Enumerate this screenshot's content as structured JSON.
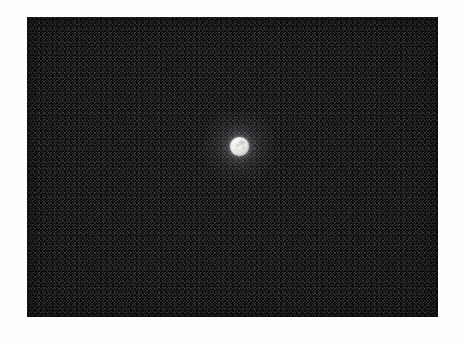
{
  "image": {
    "subject": "full-moon",
    "description": "Photograph of the full Moon as a small bright disc centred in a large expanse of grainy black night sky",
    "medium": "grainy photographic print on white paper",
    "caption": ""
  },
  "canvas": {
    "width": 465,
    "height": 345,
    "background_color": "#ffffff"
  },
  "photo": {
    "left": 27,
    "top": 17,
    "width": 411,
    "height": 300,
    "sky_color": "#0d0d0d",
    "sky_color_darkest": "#070707",
    "sky_color_lightest": "#141414",
    "grain": "heavy film grain"
  },
  "moon": {
    "label": "moon",
    "center_x": 239,
    "center_y": 146,
    "diameter": 19,
    "phase": "full",
    "disc_color": "#f4f4f0",
    "highlight_color": "#fbfbf9",
    "mare_color": "#7e807e",
    "limb_color": "#a7a8a3",
    "glow_color": "#e1e6ee",
    "surface_features": [
      {
        "name": "mare-upper-right",
        "x_pct": 62,
        "y_pct": 30
      },
      {
        "name": "mare-center-left",
        "x_pct": 40,
        "y_pct": 44
      },
      {
        "name": "mare-mid-right",
        "x_pct": 70,
        "y_pct": 58
      },
      {
        "name": "mare-lower-left",
        "x_pct": 33,
        "y_pct": 66
      },
      {
        "name": "mare-lower-center",
        "x_pct": 52,
        "y_pct": 72
      }
    ]
  },
  "border": {
    "color": "#ffffff",
    "margin_left": 27,
    "margin_top": 17,
    "margin_right": 27,
    "margin_bottom": 28
  }
}
